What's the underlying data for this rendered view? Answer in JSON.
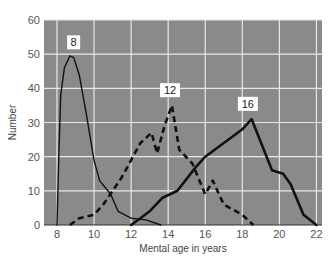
{
  "chart_data": {
    "type": "line",
    "title": "",
    "xlabel": "Mental age in years",
    "ylabel": "Number",
    "xlim": [
      7.3,
      22.3
    ],
    "ylim": [
      0,
      60
    ],
    "xticks": [
      8,
      10,
      12,
      14,
      16,
      18,
      20,
      22
    ],
    "yticks": [
      0,
      10,
      20,
      30,
      40,
      50,
      60
    ],
    "grid": true,
    "background": "#8a8a8a",
    "grid_color": "#e8e8e8",
    "series": [
      {
        "name": "8",
        "style": "solid-thin",
        "label_pos": [
          8.9,
          52
        ],
        "points": [
          [
            8.0,
            0
          ],
          [
            8.1,
            20
          ],
          [
            8.2,
            38
          ],
          [
            8.4,
            46
          ],
          [
            8.7,
            49.5
          ],
          [
            8.9,
            49
          ],
          [
            9.2,
            44
          ],
          [
            9.6,
            32
          ],
          [
            10.0,
            19
          ],
          [
            10.3,
            13
          ],
          [
            10.9,
            9
          ],
          [
            11.3,
            4
          ],
          [
            12.0,
            2
          ],
          [
            12.8,
            1.5
          ],
          [
            13.6,
            0
          ]
        ]
      },
      {
        "name": "12",
        "style": "dashed",
        "label_pos": [
          14.1,
          38
        ],
        "points": [
          [
            8.7,
            0
          ],
          [
            9.2,
            2
          ],
          [
            10.0,
            3
          ],
          [
            10.5,
            6
          ],
          [
            11.0,
            10
          ],
          [
            11.5,
            14
          ],
          [
            12.0,
            19
          ],
          [
            12.5,
            24
          ],
          [
            13.1,
            27
          ],
          [
            13.4,
            21
          ],
          [
            13.8,
            29
          ],
          [
            14.2,
            35
          ],
          [
            14.6,
            22
          ],
          [
            15.3,
            18
          ],
          [
            16.0,
            9
          ],
          [
            16.4,
            13
          ],
          [
            17.0,
            6
          ],
          [
            18.0,
            3
          ],
          [
            18.6,
            0
          ]
        ]
      },
      {
        "name": "16",
        "style": "solid-thick",
        "label_pos": [
          18.3,
          34
        ],
        "points": [
          [
            12.0,
            0
          ],
          [
            12.5,
            2
          ],
          [
            13.0,
            4
          ],
          [
            13.7,
            8
          ],
          [
            14.5,
            10
          ],
          [
            15.5,
            17
          ],
          [
            16.0,
            20
          ],
          [
            17.0,
            24
          ],
          [
            17.5,
            26
          ],
          [
            18.0,
            28
          ],
          [
            18.5,
            31
          ],
          [
            19.6,
            16
          ],
          [
            20.2,
            15
          ],
          [
            20.6,
            12
          ],
          [
            21.3,
            3
          ],
          [
            22.0,
            0
          ]
        ]
      }
    ]
  }
}
